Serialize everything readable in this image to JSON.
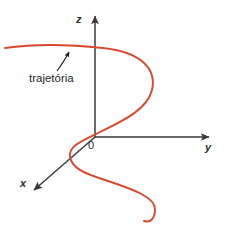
{
  "figure": {
    "title_alt": "Diagrama de eixos cartesianos tridimensionais com trajetoria helicoidal",
    "background_color": "#ffffff",
    "axis_color": "#3a3a3a",
    "curve_color": "#d9472f",
    "leader_color": "#1a1a1a",
    "axes": [
      {
        "id": "z",
        "label": "z",
        "direction": "up",
        "label_x": 76,
        "label_y": 14
      },
      {
        "id": "y",
        "label": "y",
        "direction": "right",
        "label_x": 205,
        "label_y": 142
      },
      {
        "id": "x",
        "label": "x",
        "direction": "down-left",
        "label_x": 20,
        "label_y": 180
      }
    ],
    "origin": {
      "label": "0",
      "x": 95,
      "y": 137,
      "label_x": 88,
      "label_y": 141
    },
    "annotation": {
      "label": "trajetoria",
      "label_display": "trajetória",
      "label_x": 29,
      "label_y": 74,
      "leader_from": [
        55,
        72
      ],
      "leader_to": [
        70,
        50
      ]
    },
    "curve": {
      "name": "trajetoria",
      "description": "Curva helicoidal em S iniciando a esquerda, subindo, voltando pela direita e descendo ate o canto inferior direito",
      "stroke_width": 1.9
    },
    "credit": "Banco de imagens/Arquivo da editora"
  }
}
